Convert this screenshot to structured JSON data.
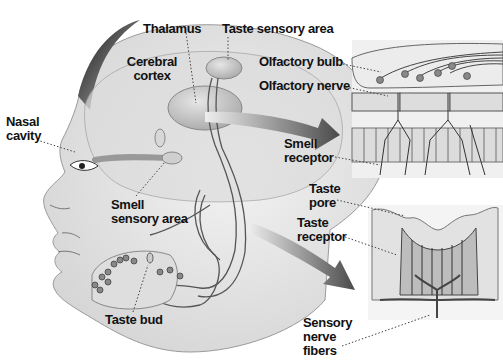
{
  "diagram": {
    "type": "anatomical illustration",
    "topic": "Smell and taste sensory pathways",
    "colors": {
      "background": "#ffffff",
      "skin": "#e9e9e9",
      "shade": "#c9c9c9",
      "dark": "#3a3a3a",
      "arrow": "#555555",
      "text": "#111111"
    },
    "labels": {
      "thalamus": "Thalamus",
      "taste_sensory_area": "Taste sensory area",
      "cerebral_cortex_line1": "Cerebral",
      "cerebral_cortex_line2": "cortex",
      "nasal_cavity_line1": "Nasal",
      "nasal_cavity_line2": "cavity",
      "olfactory_bulb": "Olfactory bulb",
      "olfactory_nerve": "Olfactory nerve",
      "smell_receptor_line1": "Smell",
      "smell_receptor_line2": "receptor",
      "smell_sensory_area_line1": "Smell",
      "smell_sensory_area_line2": "sensory area",
      "taste_pore_line1": "Taste",
      "taste_pore_line2": "pore",
      "taste_receptor_line1": "Taste",
      "taste_receptor_line2": "receptor",
      "taste_bud": "Taste bud",
      "sensory_nerve_fibers_line1": "Sensory",
      "sensory_nerve_fibers_line2": "nerve",
      "sensory_nerve_fibers_line3": "fibers"
    },
    "insets": [
      {
        "name": "olfactory-epithelium-inset",
        "shows": [
          "Olfactory bulb",
          "Olfactory nerve",
          "Smell receptor"
        ]
      },
      {
        "name": "taste-bud-inset",
        "shows": [
          "Taste pore",
          "Taste receptor",
          "Sensory nerve fibers"
        ]
      }
    ]
  }
}
